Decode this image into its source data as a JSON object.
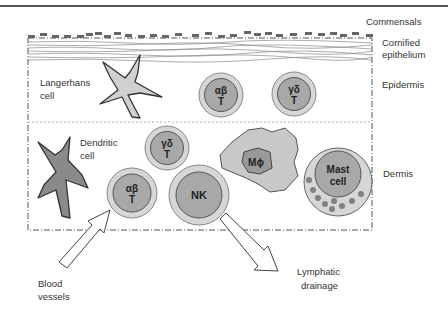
{
  "layers": {
    "commensals": "Commensals",
    "cornified": [
      "Cornified",
      "epithelium"
    ],
    "epidermis": "Epidermis",
    "dermis": "Dermis"
  },
  "cells": {
    "langerhans": [
      "Langerhans",
      "cell"
    ],
    "dendritic": [
      "Dendritic",
      "cell"
    ],
    "epi_ab_t": [
      "αβ",
      "T"
    ],
    "epi_gd_t": [
      "γδ",
      "T"
    ],
    "der_gd_t": [
      "γδ",
      "T"
    ],
    "der_ab_t": [
      "αβ",
      "T"
    ],
    "nk": "NK",
    "macrophage": "Mϕ",
    "mast": [
      "Mast",
      "cell"
    ]
  },
  "arrows": {
    "blood": [
      "Blood",
      "vessels"
    ],
    "lymph": [
      "Lymphatic",
      "drainage"
    ]
  },
  "colors": {
    "outer_cell": "#d6d6d6",
    "inner_cell": "#a8a8a8",
    "dendritic_fill": "#8a8a8a",
    "langerhans_fill": "#d0d0d0",
    "macrophage_fill": "#c8c8c8",
    "granule": "#808080",
    "border": "#555555"
  }
}
